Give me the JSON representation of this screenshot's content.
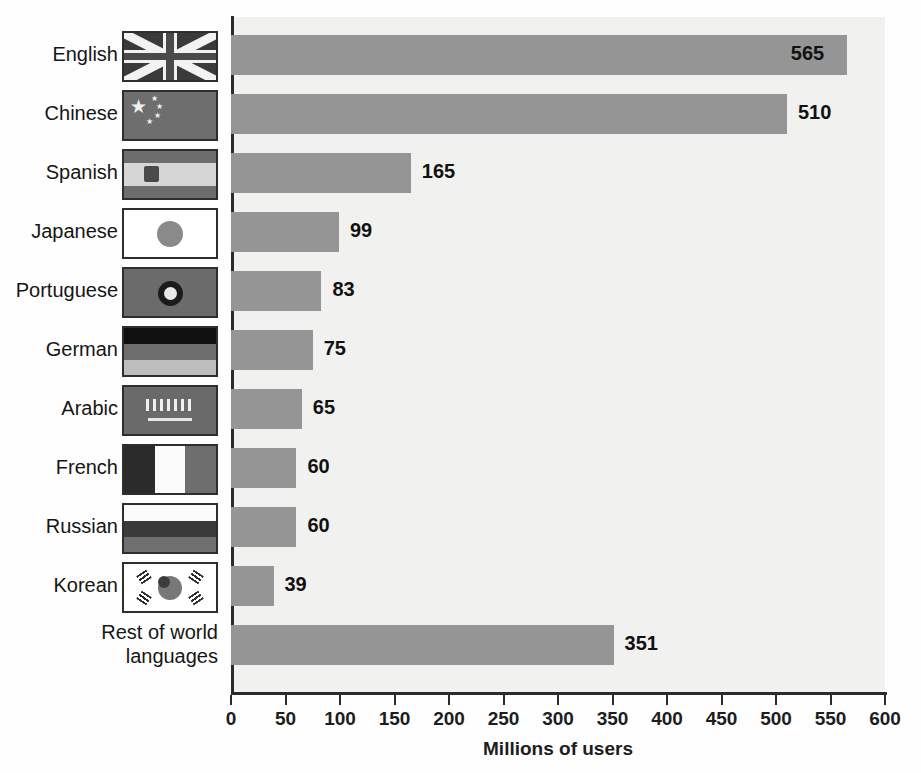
{
  "chart_data": {
    "type": "bar",
    "orientation": "horizontal",
    "title": "",
    "xlabel": "Millions of users",
    "ylabel": "",
    "xlim": [
      0,
      600
    ],
    "xticks": [
      0,
      50,
      100,
      150,
      200,
      250,
      300,
      350,
      400,
      450,
      500,
      550,
      600
    ],
    "xtick_labels": [
      "0",
      "50",
      "100",
      "150",
      "200",
      "250",
      "300",
      "350",
      "400",
      "450",
      "500",
      "550",
      "600"
    ],
    "grid": false,
    "legend": null,
    "bar_color": "#959595",
    "plot_background": "#f1f1f0",
    "categories": [
      "English",
      "Chinese",
      "Spanish",
      "Japanese",
      "Portuguese",
      "German",
      "Arabic",
      "French",
      "Russian",
      "Korean",
      "Rest of world languages"
    ],
    "values": [
      565,
      510,
      165,
      99,
      83,
      75,
      65,
      60,
      60,
      39,
      351
    ],
    "data_labels": [
      "565",
      "510",
      "165",
      "99",
      "83",
      "75",
      "65",
      "60",
      "60",
      "39",
      "351"
    ]
  },
  "rows": [
    {
      "label": "English",
      "label_lines": [
        "English"
      ],
      "value": 565,
      "data_label": "565",
      "flag": "united-kingdom-flag",
      "label_inside": true
    },
    {
      "label": "Chinese",
      "label_lines": [
        "Chinese"
      ],
      "value": 510,
      "data_label": "510",
      "flag": "china-flag",
      "label_inside": false
    },
    {
      "label": "Spanish",
      "label_lines": [
        "Spanish"
      ],
      "value": 165,
      "data_label": "165",
      "flag": "spain-flag",
      "label_inside": false
    },
    {
      "label": "Japanese",
      "label_lines": [
        "Japanese"
      ],
      "value": 99,
      "data_label": "99",
      "flag": "japan-flag",
      "label_inside": false
    },
    {
      "label": "Portuguese",
      "label_lines": [
        "Portuguese"
      ],
      "value": 83,
      "data_label": "83",
      "flag": "brazil-flag",
      "label_inside": false
    },
    {
      "label": "German",
      "label_lines": [
        "German"
      ],
      "value": 75,
      "data_label": "75",
      "flag": "germany-flag",
      "label_inside": false
    },
    {
      "label": "Arabic",
      "label_lines": [
        "Arabic"
      ],
      "value": 65,
      "data_label": "65",
      "flag": "saudi-arabia-flag",
      "label_inside": false
    },
    {
      "label": "French",
      "label_lines": [
        "French"
      ],
      "value": 60,
      "data_label": "60",
      "flag": "france-flag",
      "label_inside": false
    },
    {
      "label": "Russian",
      "label_lines": [
        "Russian"
      ],
      "value": 60,
      "data_label": "60",
      "flag": "russia-flag",
      "label_inside": false
    },
    {
      "label": "Korean",
      "label_lines": [
        "Korean"
      ],
      "value": 39,
      "data_label": "39",
      "flag": "south-korea-flag",
      "label_inside": false
    },
    {
      "label": "Rest of world languages",
      "label_lines": [
        "Rest of world",
        "languages"
      ],
      "value": 351,
      "data_label": "351",
      "flag": null,
      "label_inside": false
    }
  ],
  "axis": {
    "title": "Millions of users",
    "ticks": [
      "0",
      "50",
      "100",
      "150",
      "200",
      "250",
      "300",
      "350",
      "400",
      "450",
      "500",
      "550",
      "600"
    ]
  }
}
